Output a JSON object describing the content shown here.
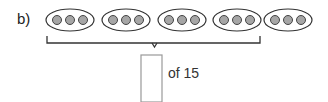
{
  "problem": {
    "label": "b)",
    "groups": 5,
    "dots_per_group": 3,
    "bracketed_groups": 4,
    "answer_box_value": "",
    "of_text": "of 15"
  },
  "colors": {
    "dot_fill": "#a6a6a6",
    "stroke": "#333333",
    "box_stroke": "#999999"
  }
}
